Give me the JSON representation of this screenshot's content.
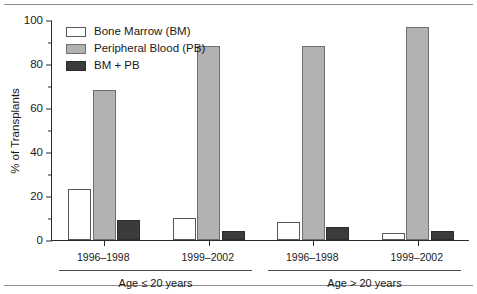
{
  "chart_data": {
    "type": "bar",
    "title": "",
    "subtitle": "",
    "xlabel": "",
    "ylabel": "% of Transplants",
    "ylim": [
      0,
      100
    ],
    "ytick_labels": [
      "0",
      "20",
      "40",
      "60",
      "80",
      "100"
    ],
    "ytick_values": [
      0,
      20,
      40,
      60,
      80,
      100
    ],
    "yminor_values": [
      10,
      30,
      50,
      70,
      90
    ],
    "grid": false,
    "legend_position": "top-left",
    "categories": [
      "1996–1998",
      "1999–2002",
      "1996–1998",
      "1999–2002"
    ],
    "group_labels": [
      "Age ≤ 20 years",
      "Age > 20 years"
    ],
    "groups": [
      {
        "label": "Age ≤ 20 years",
        "periods": [
          {
            "category": "1996–1998",
            "bone_marrow": 23,
            "peripheral_blood": 68,
            "bm_plus_pb": 9
          },
          {
            "category": "1999–2002",
            "bone_marrow": 10,
            "peripheral_blood": 88,
            "bm_plus_pb": 4
          }
        ]
      },
      {
        "label": "Age > 20 years",
        "periods": [
          {
            "category": "1996–1998",
            "bone_marrow": 8,
            "peripheral_blood": 88,
            "bm_plus_pb": 6
          },
          {
            "category": "1999–2002",
            "bone_marrow": 3,
            "peripheral_blood": 97,
            "bm_plus_pb": 4
          }
        ]
      }
    ],
    "series": [
      {
        "name": "Bone Marrow (BM)",
        "key": "bone_marrow",
        "color": "#ffffff",
        "values": [
          23,
          10,
          8,
          3
        ]
      },
      {
        "name": "Peripheral Blood (PB)",
        "key": "peripheral_blood",
        "color": "#b2b2b2",
        "values": [
          68,
          88,
          88,
          97
        ]
      },
      {
        "name": "BM + PB",
        "key": "bm_plus_pb",
        "color": "#3b3b3b",
        "values": [
          9,
          4,
          6,
          4
        ]
      }
    ]
  },
  "legend": {
    "items": [
      {
        "label": "Bone Marrow (BM)",
        "swatch": "bm"
      },
      {
        "label": "Peripheral Blood (PB)",
        "swatch": "pb"
      },
      {
        "label": "BM + PB",
        "swatch": "bmpb"
      }
    ]
  },
  "axes": {
    "y_title": "% of Transplants",
    "y_labels": [
      "100",
      "80",
      "60",
      "40",
      "20",
      "0"
    ]
  },
  "colors": {
    "bone_marrow": "#ffffff",
    "peripheral_blood": "#b2b2b2",
    "bm_plus_pb": "#3b3b3b",
    "axis": "#2a2a2a",
    "rule": "#8d8d8d",
    "text": "#1a1a1a"
  }
}
